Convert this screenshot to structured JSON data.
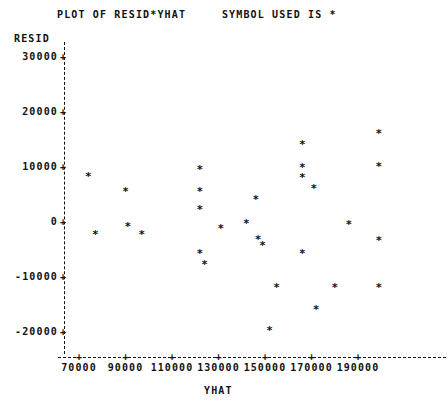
{
  "title": "PLOT OF RESID*YHAT     SYMBOL USED IS *",
  "axes": {
    "y_name": "RESID",
    "x_name": "YHAT",
    "y_ticks": [
      "30000",
      "20000",
      "10000",
      "0",
      "-10000",
      "-20000"
    ],
    "x_ticks": [
      "70000",
      "90000",
      "110000",
      "130000",
      "150000",
      "170000",
      "190000"
    ],
    "tick_marker": "+"
  },
  "symbol": "*",
  "chart_data": {
    "type": "scatter",
    "title": "PLOT OF RESID*YHAT     SYMBOL USED IS *",
    "xlabel": "YHAT",
    "ylabel": "RESID",
    "xlim": [
      63000,
      205000
    ],
    "ylim": [
      -24000,
      31000
    ],
    "xticks": [
      70000,
      90000,
      110000,
      130000,
      150000,
      170000,
      190000
    ],
    "yticks": [
      -20000,
      -10000,
      0,
      10000,
      20000,
      30000
    ],
    "grid": false,
    "legend": null,
    "marker": "*",
    "series": [
      {
        "name": "RESID vs YHAT",
        "points": [
          {
            "x": 74000,
            "y": 8400
          },
          {
            "x": 77000,
            "y": -2200
          },
          {
            "x": 90000,
            "y": 5600
          },
          {
            "x": 91000,
            "y": -800
          },
          {
            "x": 97000,
            "y": -2200
          },
          {
            "x": 122000,
            "y": 9600
          },
          {
            "x": 122000,
            "y": 5600
          },
          {
            "x": 122000,
            "y": 2400
          },
          {
            "x": 122000,
            "y": -5600
          },
          {
            "x": 124000,
            "y": -7600
          },
          {
            "x": 131000,
            "y": -1000
          },
          {
            "x": 142000,
            "y": -200
          },
          {
            "x": 146000,
            "y": 4200
          },
          {
            "x": 147000,
            "y": -3000
          },
          {
            "x": 149000,
            "y": -4200
          },
          {
            "x": 152000,
            "y": -19600
          },
          {
            "x": 155000,
            "y": -11800
          },
          {
            "x": 166000,
            "y": 14200
          },
          {
            "x": 166000,
            "y": 10000
          },
          {
            "x": 166000,
            "y": 8200
          },
          {
            "x": 166000,
            "y": -5600
          },
          {
            "x": 171000,
            "y": 6200
          },
          {
            "x": 172000,
            "y": -15800
          },
          {
            "x": 180000,
            "y": -11800
          },
          {
            "x": 186000,
            "y": -400
          },
          {
            "x": 199000,
            "y": 16200
          },
          {
            "x": 199000,
            "y": 10200
          },
          {
            "x": 199000,
            "y": -3200
          },
          {
            "x": 199000,
            "y": -11800
          }
        ]
      }
    ]
  }
}
